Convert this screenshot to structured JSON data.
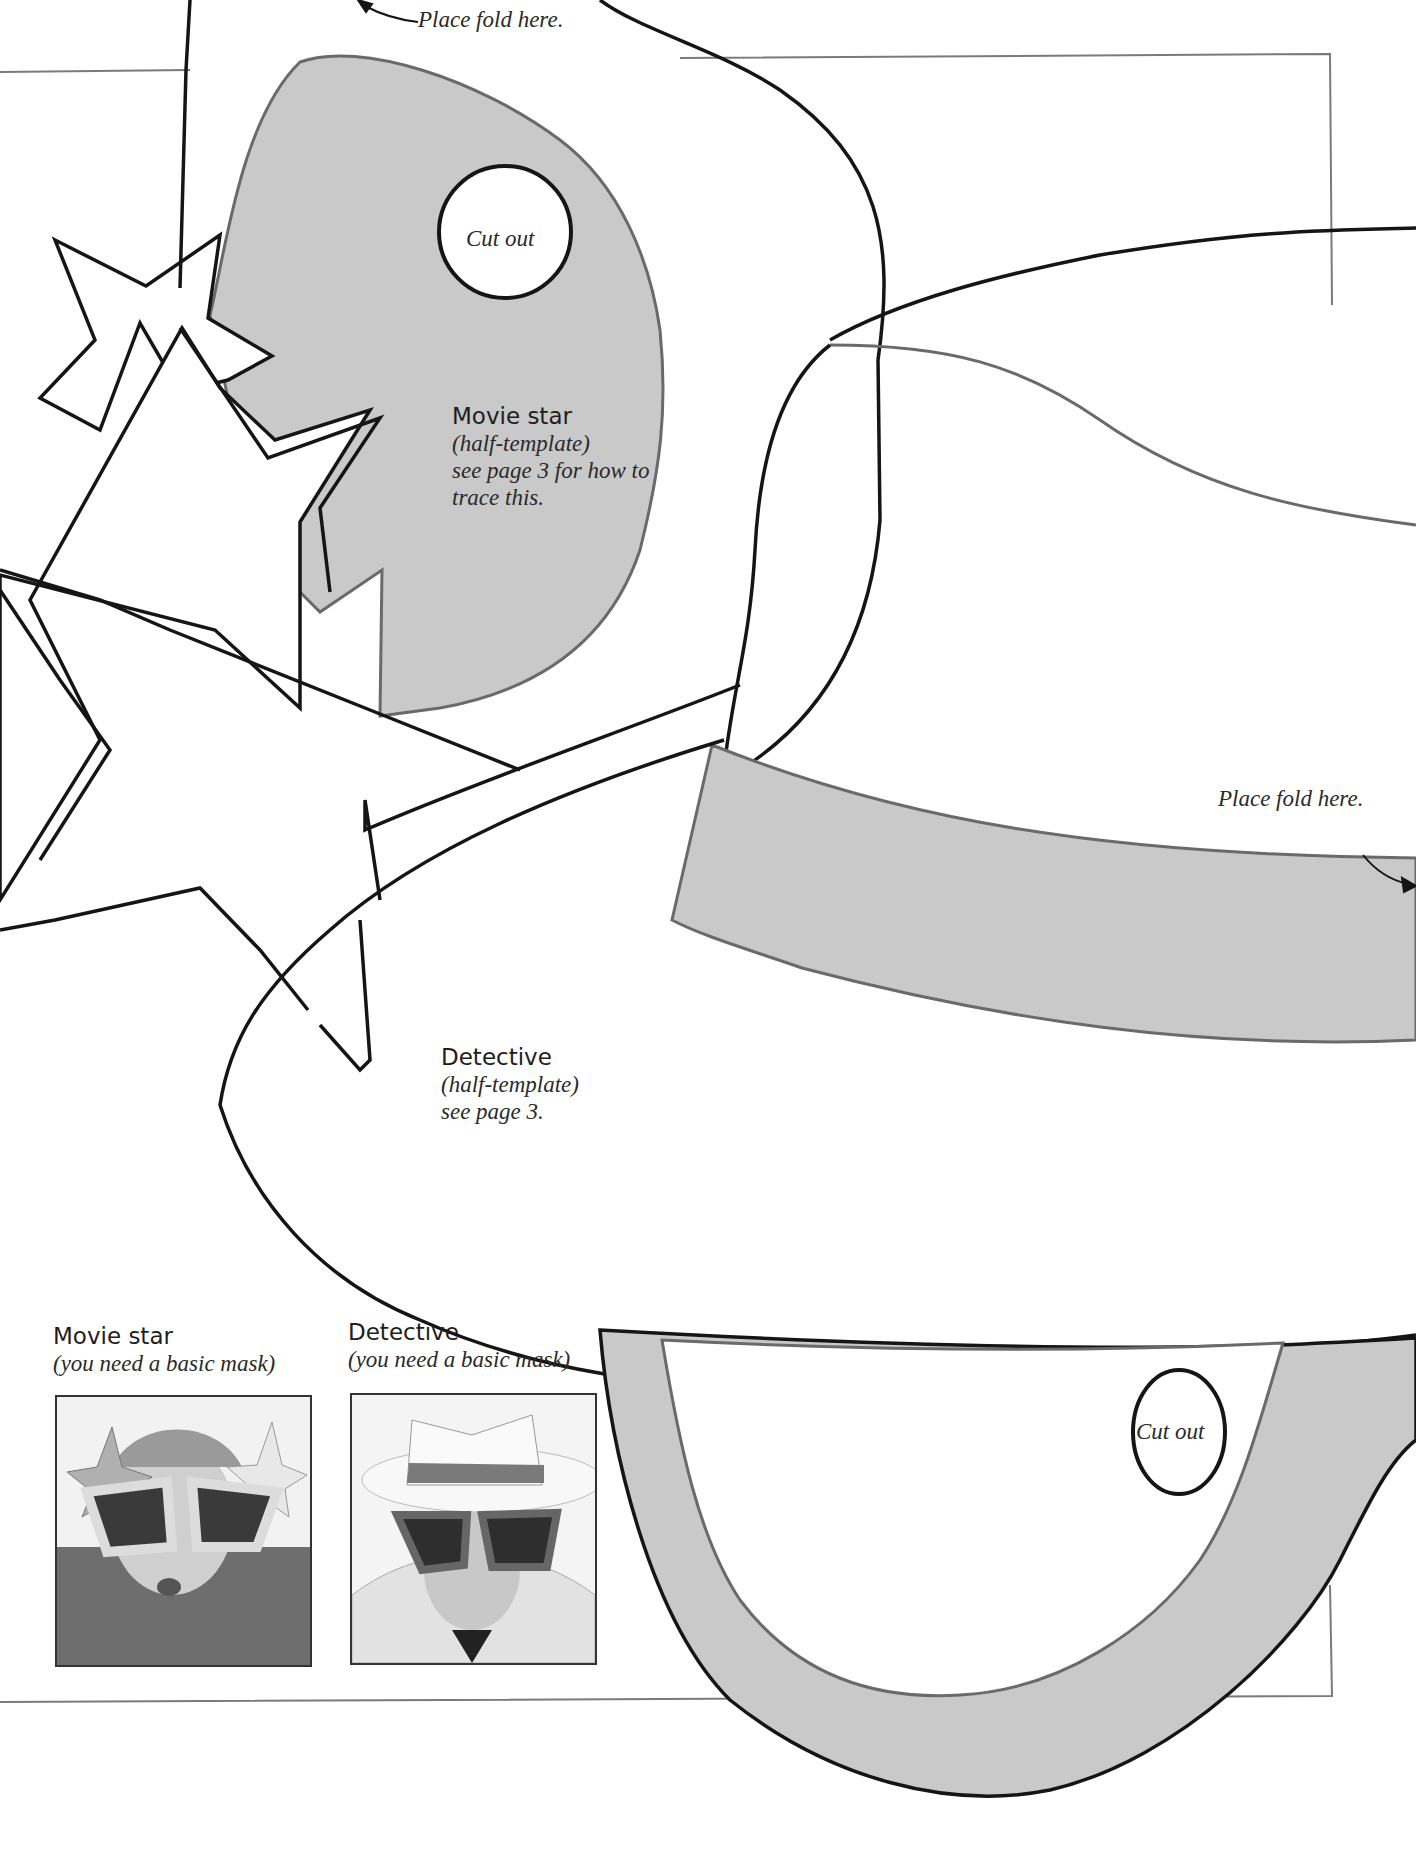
{
  "fold_labels": {
    "top": "Place fold here.",
    "right": "Place fold here."
  },
  "cutout_labels": {
    "movie_star": "Cut out",
    "detective": "Cut out"
  },
  "templates": {
    "movie_star": {
      "title": "Movie star",
      "line1": "(half-template)",
      "line2": "see page 3 for how to",
      "line3": "trace this."
    },
    "detective": {
      "title": "Detective",
      "line1": "(half-template)",
      "line2": "see page 3."
    }
  },
  "examples": [
    {
      "title": "Movie star",
      "note": "(you need a basic mask)",
      "photo": "movie-star-mask-photo"
    },
    {
      "title": "Detective",
      "note": "(you need a basic mask)",
      "photo": "detective-mask-photo"
    }
  ],
  "colors": {
    "fill_gray": "#c9c9c9",
    "outline_black": "#151515",
    "outline_gray": "#6a6a6a"
  }
}
